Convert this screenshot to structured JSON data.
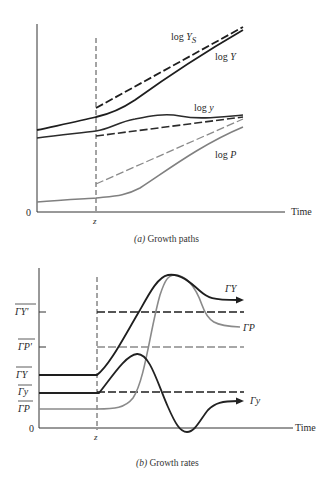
{
  "figure": {
    "panel_a": {
      "caption_prefix": "(a)",
      "caption_text": " Growth paths",
      "x_axis_label": "Time",
      "origin_label": "0",
      "event_label": "z",
      "curves": [
        {
          "id": "logYS",
          "label_base": "log ",
          "label_var": "Y",
          "label_sub": "S",
          "style": "dashed",
          "color": "#1e1e1e"
        },
        {
          "id": "logY",
          "label_base": "log ",
          "label_var": "Y",
          "label_sub": "",
          "style": "solid",
          "color": "#1e1e1e"
        },
        {
          "id": "logy",
          "label_base": "log ",
          "label_var": "y",
          "label_sub": "",
          "style": "solid",
          "color": "#333333"
        },
        {
          "id": "logy_trend",
          "label_base": "",
          "label_var": "",
          "label_sub": "",
          "style": "dashed",
          "color": "#333333"
        },
        {
          "id": "logP_trend",
          "label_base": "",
          "label_var": "",
          "label_sub": "",
          "style": "dashed",
          "color": "#8a8a8a"
        },
        {
          "id": "logP",
          "label_base": "log ",
          "label_var": "P",
          "label_sub": "",
          "style": "solid",
          "color": "#808080"
        }
      ]
    },
    "panel_b": {
      "caption_prefix": "(b)",
      "caption_text": " Growth rates",
      "x_axis_label": "Time",
      "origin_label": "0",
      "event_label": "z",
      "y_levels": [
        {
          "id": "GYp",
          "label": "ΓY'"
        },
        {
          "id": "GPp",
          "label": "ΓP'"
        },
        {
          "id": "GY",
          "label": "ΓY"
        },
        {
          "id": "Gy",
          "label": "Γy"
        },
        {
          "id": "GP",
          "label": "ΓP"
        }
      ],
      "curves": [
        {
          "id": "GammaY",
          "label": "ΓY",
          "color": "#1e1e1e"
        },
        {
          "id": "GammaP",
          "label": "ΓP",
          "color": "#8a8a8a"
        },
        {
          "id": "Gammay",
          "label": "Γy",
          "color": "#2a2a2a"
        }
      ]
    }
  }
}
